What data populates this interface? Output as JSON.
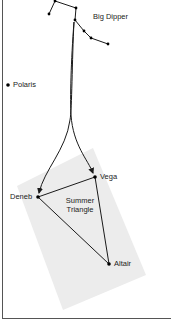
{
  "diagram": {
    "colors": {
      "background": "#ffffff",
      "line": "#1a1a1a",
      "star": "#000000",
      "shaded_region": "#ececec",
      "frame": "#555555"
    },
    "labels": {
      "big_dipper": "Big Dipper",
      "polaris": "Polaris",
      "vega": "Vega",
      "deneb": "Deneb",
      "altair": "Altair",
      "summer_triangle_line1": "Summer",
      "summer_triangle_line2": "Triangle"
    },
    "stars": [
      {
        "name": "Polaris",
        "x": 8,
        "y": 85
      },
      {
        "name": "Vega",
        "x": 95,
        "y": 177
      },
      {
        "name": "Deneb",
        "x": 38,
        "y": 197
      },
      {
        "name": "Altair",
        "x": 109,
        "y": 264
      }
    ],
    "big_dipper_stars": [
      {
        "x": 49,
        "y": 14
      },
      {
        "x": 55,
        "y": 1
      },
      {
        "x": 76,
        "y": 8
      },
      {
        "x": 75,
        "y": 20
      },
      {
        "x": 84,
        "y": 31
      },
      {
        "x": 91,
        "y": 38
      },
      {
        "x": 108,
        "y": 44
      }
    ]
  }
}
